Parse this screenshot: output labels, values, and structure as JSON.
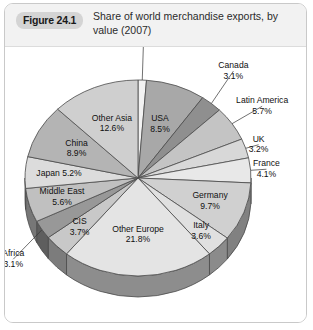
{
  "figure": {
    "badge": "Figure 24.1",
    "title": "Share of world merchandise exports, by value (2007)"
  },
  "chart_data": {
    "type": "pie",
    "title": "Share of world merchandise exports, by value (2007)",
    "subtitle": "",
    "xlabel": "",
    "ylabel": "",
    "units": "percent",
    "legend": "none",
    "grid": false,
    "three_d": true,
    "start_angle_deg": 0,
    "direction": "clockwise",
    "categories": [
      "Australasia",
      "USA",
      "Canada",
      "Latin America",
      "UK",
      "France",
      "Germany",
      "Italy",
      "Other Europe",
      "CIS",
      "Africa",
      "Middle East",
      "Japan",
      "China",
      "Other Asia"
    ],
    "values": [
      1.2,
      8.5,
      3.1,
      5.7,
      3.2,
      4.1,
      9.7,
      3.6,
      21.8,
      3.7,
      3.1,
      5.6,
      5.2,
      8.9,
      12.6
    ],
    "slices": [
      {
        "name": "Australasia",
        "value": 1.2,
        "label": "Australasia",
        "value_label": "1.2%",
        "color": "#f2f2f2",
        "label_placement": "outside-top"
      },
      {
        "name": "USA",
        "value": 8.5,
        "label": "USA",
        "value_label": "8.5%",
        "color": "#a8a8a8",
        "label_placement": "inside"
      },
      {
        "name": "Canada",
        "value": 3.1,
        "label": "Canada",
        "value_label": "3.1%",
        "color": "#8f8f8f",
        "label_placement": "outside-right"
      },
      {
        "name": "Latin America",
        "value": 5.7,
        "label": "Latin America",
        "value_label": "5.7%",
        "color": "#c4c4c4",
        "label_placement": "outside-right"
      },
      {
        "name": "UK",
        "value": 3.2,
        "label": "UK",
        "value_label": "3.2%",
        "color": "#d8d8d8",
        "label_placement": "outside-right"
      },
      {
        "name": "France",
        "value": 4.1,
        "label": "France",
        "value_label": "4.1%",
        "color": "#e8e8e8",
        "label_placement": "outside-right"
      },
      {
        "name": "Germany",
        "value": 9.7,
        "label": "Germany",
        "value_label": "9.7%",
        "color": "#d0d0d0",
        "label_placement": "inside"
      },
      {
        "name": "Italy",
        "value": 3.6,
        "label": "Italy",
        "value_label": "3.6%",
        "color": "#e0e0e0",
        "label_placement": "inside"
      },
      {
        "name": "Other Europe",
        "value": 21.8,
        "label": "Other Europe",
        "value_label": "21.8%",
        "color": "#e4e4e4",
        "label_placement": "inside"
      },
      {
        "name": "CIS",
        "value": 3.7,
        "label": "CIS",
        "value_label": "3.7%",
        "color": "#c8c8c8",
        "label_placement": "inside"
      },
      {
        "name": "Africa",
        "value": 3.1,
        "label": "Africa",
        "value_label": "3.1%",
        "color": "#989898",
        "label_placement": "outside-left"
      },
      {
        "name": "Middle East",
        "value": 5.6,
        "label": "Middle East",
        "value_label": "5.6%",
        "color": "#c0c0c0",
        "label_placement": "inside"
      },
      {
        "name": "Japan",
        "value": 5.2,
        "label": "Japan 5.2%",
        "value_label": "",
        "color": "#dcdcdc",
        "label_placement": "inside"
      },
      {
        "name": "China",
        "value": 8.9,
        "label": "China",
        "value_label": "8.9%",
        "color": "#b4b4b4",
        "label_placement": "inside"
      },
      {
        "name": "Other Asia",
        "value": 12.6,
        "label": "Other Asia",
        "value_label": "12.6%",
        "color": "#cfcfcf",
        "label_placement": "inside"
      }
    ],
    "labels_rendered": [
      "Australasia 1.2%",
      "USA 8.5%",
      "Canada 3.1%",
      "Latin America 5.7%",
      "UK 3.2%",
      "France 4.1%",
      "Germany 9.7%",
      "Italy 3.6%",
      "Other Europe 21.8%",
      "CIS 3.7%",
      "Africa 3.1%",
      "Middle East 5.6%",
      "Japan 5.2%",
      "China 8.9%",
      "Other Asia 12.6%"
    ]
  },
  "colors": {
    "panel_border": "#c9c9c9",
    "header_bg": "#f2f2f2",
    "badge_bg": "#d4d4d4",
    "rim_dark": "#8a8a8a",
    "outline": "#4a4a4a"
  }
}
